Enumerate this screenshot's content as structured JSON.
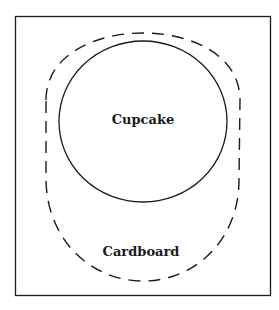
{
  "diagram": {
    "labels": {
      "inner": "Cupcake",
      "outer": "Cardboard"
    },
    "colors": {
      "stroke": "#1a1a1a",
      "background": "#ffffff"
    }
  }
}
